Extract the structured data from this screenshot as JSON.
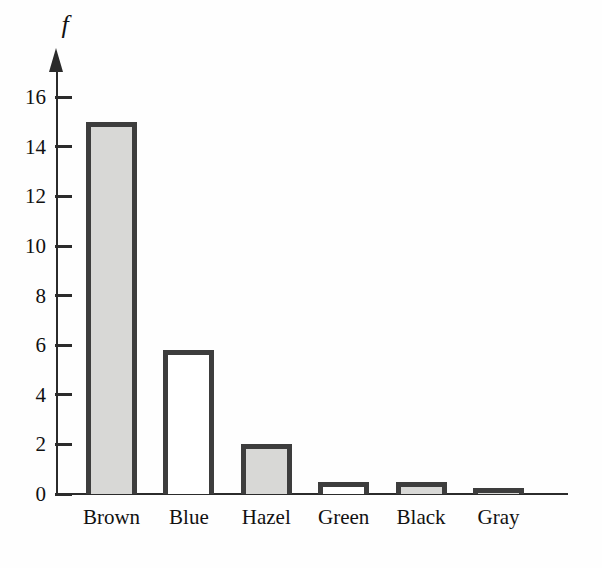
{
  "figure": {
    "background": "#fefefe"
  },
  "chart_data": {
    "type": "bar",
    "title": "",
    "xlabel": "",
    "ylabel": "f",
    "categories": [
      "Brown",
      "Blue",
      "Hazel",
      "Green",
      "Black",
      "Gray"
    ],
    "values": [
      15,
      5.8,
      2,
      0.5,
      0.5,
      0.1
    ],
    "bar_fills": [
      "#d8d8d6",
      "#ffffff",
      "#d8d8d6",
      "#ffffff",
      "#d8d8d6",
      "#d8d8d6"
    ],
    "bar_border_color": "#3d3d3d",
    "axis_color": "#2b2b2b",
    "text_color": "#111111",
    "yticks": [
      0,
      2,
      4,
      6,
      8,
      10,
      12,
      14,
      16
    ],
    "ylim": [
      0,
      17.6
    ],
    "grid": false,
    "legend_position": "none",
    "y_axis_arrow": true
  }
}
